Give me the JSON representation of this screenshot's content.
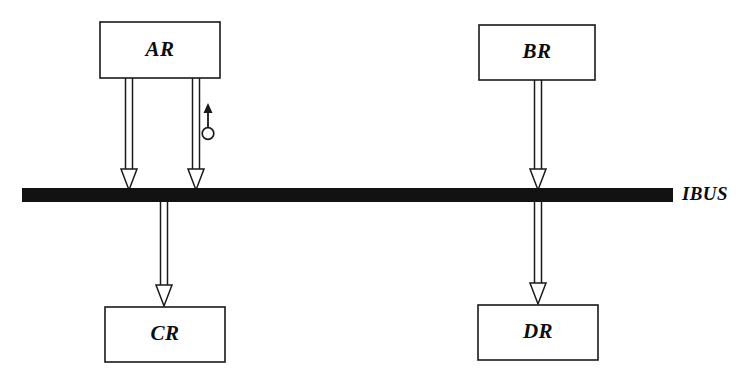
{
  "diagram": {
    "canvas": {
      "width": 747,
      "height": 383,
      "background": "#ffffff"
    },
    "ink_color": "#1a1a1a",
    "bus_color": "#121212",
    "boxes": [
      {
        "id": "ar",
        "label": "AR",
        "x": 100,
        "y": 22,
        "width": 120,
        "height": 56
      },
      {
        "id": "br",
        "label": "BR",
        "x": 479,
        "y": 25,
        "width": 116,
        "height": 55
      },
      {
        "id": "cr",
        "label": "CR",
        "x": 105,
        "y": 307,
        "width": 120,
        "height": 55
      },
      {
        "id": "dr",
        "label": "DR",
        "x": 478,
        "y": 305,
        "width": 120,
        "height": 55
      }
    ],
    "bus": {
      "id": "ibus",
      "label": "IBUS",
      "x": 22,
      "y": 188,
      "width": 651,
      "height": 14,
      "label_x": 682,
      "label_y": 195
    },
    "connections": [
      {
        "id": "ar-to-bus-left",
        "from": "ar",
        "to": "ibus",
        "x": 129,
        "y_start": 78,
        "y_end": 190,
        "direction": "down"
      },
      {
        "id": "ar-to-bus-right",
        "from": "ar",
        "to": "ibus",
        "x": 196,
        "y_start": 78,
        "y_end": 190,
        "direction": "down"
      },
      {
        "id": "bus-to-cr",
        "from": "ibus",
        "to": "cr",
        "x": 164,
        "y_start": 200,
        "y_end": 306,
        "direction": "down"
      },
      {
        "id": "br-to-bus",
        "from": "br",
        "to": "ibus",
        "x": 538,
        "y_start": 80,
        "y_end": 190,
        "direction": "down"
      },
      {
        "id": "bus-to-dr",
        "from": "ibus",
        "to": "dr",
        "x": 538,
        "y_start": 200,
        "y_end": 304,
        "direction": "down"
      }
    ],
    "control_marker": {
      "id": "ar-control-signal",
      "x": 208,
      "arrow_tip_y": 104,
      "stem_bottom_y": 126,
      "circle_cy": 133,
      "circle_r": 6
    }
  }
}
